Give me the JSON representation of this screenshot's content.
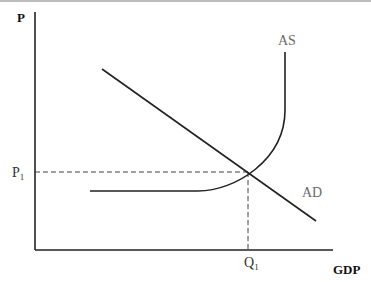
{
  "diagram": {
    "axes": {
      "y_label": "P",
      "x_label": "GDP"
    },
    "curves": [
      {
        "name": "AS",
        "label": "AS",
        "shape": "horizontal then upward-curving then vertical"
      },
      {
        "name": "AD",
        "label": "AD",
        "shape": "downward-sloping line"
      }
    ],
    "equilibrium": {
      "price_label": "P",
      "price_sub": "1",
      "quantity_label": "Q",
      "quantity_sub": "1"
    },
    "colors": {
      "line": "#222222",
      "label": "#6a6a6a",
      "axis": "#222222"
    }
  }
}
